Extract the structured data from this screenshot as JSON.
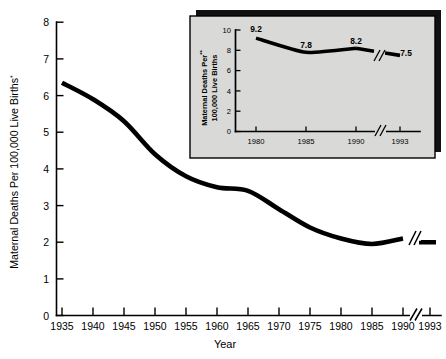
{
  "chart_data": [
    {
      "id": "main",
      "type": "line",
      "title": "",
      "xlabel": "Year",
      "ylabel": "Maternal Deaths Per 100,000 Live Births*",
      "ylabel_superscript": "*",
      "xlim": [
        1935,
        1993
      ],
      "ylim": [
        0,
        8
      ],
      "ytick_labels": [
        "0",
        "1",
        "2",
        "3",
        "4",
        "5",
        "6",
        "7",
        "8"
      ],
      "ytick_values": [
        0,
        1,
        2,
        3,
        4,
        5,
        6,
        7,
        8
      ],
      "xtick_labels": [
        "1935",
        "1940",
        "1945",
        "1950",
        "1955",
        "1960",
        "1965",
        "1970",
        "1975",
        "1980",
        "1985",
        "1990",
        "1993"
      ],
      "xtick_values": [
        1935,
        1940,
        1945,
        1950,
        1955,
        1960,
        1965,
        1970,
        1975,
        1980,
        1985,
        1990,
        1993
      ],
      "axis_break_between": [
        1990,
        1993
      ],
      "grid": false,
      "legend": "none",
      "x": [
        1935,
        1940,
        1945,
        1950,
        1955,
        1960,
        1965,
        1970,
        1975,
        1980,
        1985,
        1990,
        1993
      ],
      "values": [
        6.35,
        5.9,
        5.3,
        4.4,
        3.8,
        3.5,
        3.4,
        2.9,
        2.4,
        2.1,
        1.95,
        2.1,
        2.0
      ],
      "series_name": "Maternal mortality rate"
    },
    {
      "id": "inset",
      "type": "line",
      "title": "",
      "xlabel": "",
      "ylabel": "Maternal Deaths Per 100,000 Live Births**",
      "ylabel_line1": "Maternal Deaths Per",
      "ylabel_line2": "100,000 Live Births",
      "ylabel_superscript": "**",
      "xlim": [
        1980,
        1993
      ],
      "ylim": [
        0,
        10
      ],
      "ytick_labels": [
        "0",
        "2",
        "4",
        "6",
        "8",
        "10"
      ],
      "ytick_values": [
        0,
        2,
        4,
        6,
        8,
        10
      ],
      "xtick_labels": [
        "1980",
        "1985",
        "1990",
        "1993"
      ],
      "xtick_values": [
        1980,
        1985,
        1990,
        1993
      ],
      "axis_break_between": [
        1990,
        1993
      ],
      "grid": false,
      "legend": "none",
      "x": [
        1980,
        1985,
        1990,
        1993
      ],
      "values": [
        9.2,
        7.8,
        8.2,
        7.5
      ],
      "data_labels": [
        "9.2",
        "7.8",
        "8.2",
        "7.5"
      ],
      "series_name": "Maternal mortality rate (recent)"
    }
  ],
  "main_chart": {
    "x_axis_title": "Year",
    "y_axis_title_text": "Maternal Deaths Per 100,000 Live Births",
    "y_axis_superscript": "*",
    "ytick_0": "0",
    "ytick_1": "1",
    "ytick_2": "2",
    "ytick_3": "3",
    "ytick_4": "4",
    "ytick_5": "5",
    "ytick_6": "6",
    "ytick_7": "7",
    "ytick_8": "8",
    "xtick_1935": "1935",
    "xtick_1940": "1940",
    "xtick_1945": "1945",
    "xtick_1950": "1950",
    "xtick_1955": "1955",
    "xtick_1960": "1960",
    "xtick_1965": "1965",
    "xtick_1970": "1970",
    "xtick_1975": "1975",
    "xtick_1980": "1980",
    "xtick_1985": "1985",
    "xtick_1990": "1990",
    "xtick_1993": "1993"
  },
  "inset_chart": {
    "y_axis_title_line1": "Maternal Deaths Per",
    "y_axis_title_line2": "100,000 Live Births",
    "y_axis_superscript": "**",
    "ytick_0": "0",
    "ytick_2": "2",
    "ytick_4": "4",
    "ytick_6": "6",
    "ytick_8": "8",
    "ytick_10": "10",
    "xtick_1980": "1980",
    "xtick_1985": "1985",
    "xtick_1990": "1990",
    "xtick_1993": "1993",
    "label_1980": "9.2",
    "label_1985": "7.8",
    "label_1990": "8.2",
    "label_1993": "7.5"
  },
  "colors": {
    "line": "#000000",
    "axis": "#000000",
    "background": "#ffffff",
    "inset_panel": "#d9d9d7",
    "inset_shadow": "#111111"
  }
}
